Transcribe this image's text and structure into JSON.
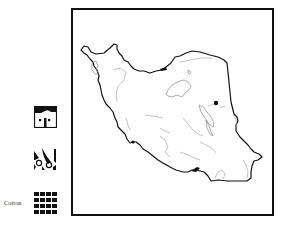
{
  "map": {
    "subject": "Iran",
    "frame_color": "#111111",
    "border_color": "#111111",
    "river_color": "#9a9a9a",
    "city_marker": "filled-dot"
  },
  "legend": {
    "items": [
      {
        "icon": "dwelling-icon",
        "label": ""
      },
      {
        "icon": "tools-icon",
        "label": ""
      },
      {
        "icon": "grid-icon",
        "label": "Cotton"
      }
    ]
  }
}
